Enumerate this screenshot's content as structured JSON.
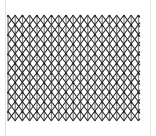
{
  "figure": {
    "title": "Triangular Lattice Pattern",
    "type": "lattice-diagram",
    "background_color": "#ffffff",
    "card": {
      "x": 5,
      "y": 0,
      "width": 146,
      "height": 136,
      "border_color": "#e2e2e2",
      "fill_color": "#ffffff"
    },
    "plot_area": {
      "x": 8,
      "y": 15,
      "width": 132,
      "height": 106
    },
    "lattice": {
      "lattice_type": "triangular",
      "column_spacing": 14.5,
      "row_spacing": 9.6,
      "columns": 10,
      "rows": 12,
      "vertical_line_color": "#8a8a8a",
      "vertical_line_width": 1.3,
      "diagonal_line_color": "#2b2b2b",
      "diagonal_line_width": 1.1,
      "node_color": "#1a1a1a",
      "node_radius": 1.0,
      "show_vertical_lines": true,
      "show_diagonal_lines": true,
      "show_nodes": true
    }
  },
  "chart_data": {
    "type": "scatter",
    "title": "Triangular Lattice Pattern",
    "xlabel": "",
    "ylabel": "",
    "xlim": [
      8,
      140
    ],
    "ylim": [
      15,
      121
    ],
    "grid": false,
    "legend": null,
    "tick_labels_x": [],
    "tick_labels_y": [],
    "annotations": [],
    "series": [
      {
        "name": "lattice-nodes",
        "marker": "dot",
        "color": "#1a1a1a",
        "x_start": 8,
        "x_step": 14.5,
        "x_count": 10,
        "y_start": 16,
        "y_step": 9.6,
        "y_count": 12,
        "row_offset_alternating": 7.25
      }
    ],
    "edges": [
      {
        "name": "vertical",
        "color": "#8a8a8a",
        "angle_deg": 90
      },
      {
        "name": "diagonal-up",
        "color": "#2b2b2b",
        "angle_deg": 33
      },
      {
        "name": "diagonal-down",
        "color": "#2b2b2b",
        "angle_deg": -33
      }
    ]
  }
}
